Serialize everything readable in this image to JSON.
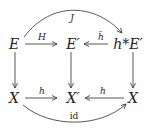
{
  "diagram": {
    "type": "commutative-diagram",
    "nodes": {
      "E": {
        "label": "E",
        "x": 14,
        "y": 44
      },
      "Eprime": {
        "label": "E′",
        "x": 73,
        "y": 44
      },
      "hstarEprime": {
        "label": "h*E′",
        "x": 128,
        "y": 44
      },
      "X_left": {
        "label": "X",
        "x": 14,
        "y": 98
      },
      "Xprime": {
        "label": "X′",
        "x": 73,
        "y": 98
      },
      "X_right": {
        "label": "X",
        "x": 133,
        "y": 98
      }
    },
    "edges": [
      {
        "from": "E",
        "to": "Eprime",
        "label": "H"
      },
      {
        "from": "hstarEprime",
        "to": "Eprime",
        "label": "h̄"
      },
      {
        "from": "E",
        "to": "hstarEprime",
        "label": "J",
        "curved": "above"
      },
      {
        "from": "E",
        "to": "X_left",
        "label": ""
      },
      {
        "from": "Eprime",
        "to": "Xprime",
        "label": ""
      },
      {
        "from": "hstarEprime",
        "to": "X_right",
        "label": ""
      },
      {
        "from": "X_left",
        "to": "Xprime",
        "label": "h"
      },
      {
        "from": "X_right",
        "to": "Xprime",
        "label": "h"
      },
      {
        "from": "X_left",
        "to": "X_right",
        "label": "id",
        "curved": "below"
      }
    ],
    "labels": {
      "H": "H",
      "hbar": "h̄",
      "J": "J",
      "h_left": "h",
      "h_right": "h",
      "id": "id"
    },
    "colors": {
      "stroke": "#444444",
      "text": "#222222"
    }
  }
}
